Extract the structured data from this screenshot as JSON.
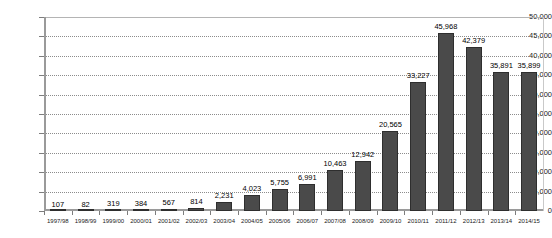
{
  "chart_data": {
    "type": "bar",
    "title": "",
    "subtitle": "",
    "xlabel": "",
    "ylabel": "",
    "ylim": [
      0,
      50000
    ],
    "ytick_step": 5000,
    "grid": true,
    "legend": false,
    "bar_color": "#4a4a4a",
    "bar_border_color": "#2e2e2e",
    "axis_color": "#9a9a9a",
    "gridline_color": "#8c8c8c",
    "categories": [
      "1997/98",
      "1998/99",
      "1999/00",
      "2000/01",
      "2001/02",
      "2002/03",
      "2003/04",
      "2004/05",
      "2005/06",
      "2006/07",
      "2007/08",
      "2008/09",
      "2009/10",
      "2010/11",
      "2011/12",
      "2012/13",
      "2013/14",
      "2014/15"
    ],
    "values": [
      107,
      82,
      319,
      384,
      567,
      814,
      2231,
      4023,
      5755,
      6991,
      10463,
      12942,
      20565,
      33227,
      45968,
      42379,
      35891,
      35899
    ],
    "data_labels": [
      "107",
      "82",
      "319",
      "384",
      "567",
      "814",
      "2,231",
      "4,023",
      "5,755",
      "6,991",
      "10,463",
      "12,942",
      "20,565",
      "33,227",
      "45,968",
      "42,379",
      "35,891",
      "35,899"
    ],
    "ytick_labels": [
      "0",
      "5,000",
      "10,000",
      "15,000",
      "20,000",
      "25,000",
      "30,000",
      "35,000",
      "40,000",
      "45,000",
      "50,000"
    ],
    "ytick_values": [
      0,
      5000,
      10000,
      15000,
      20000,
      25000,
      30000,
      35000,
      40000,
      45000,
      50000
    ]
  }
}
